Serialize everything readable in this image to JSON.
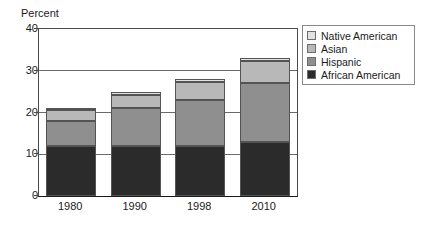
{
  "chart_data": {
    "type": "bar",
    "subtype": "stacked-bar",
    "title": "",
    "xlabel": "",
    "ylabel": "Percent",
    "ylim": [
      0,
      40
    ],
    "yticks": [
      0,
      10,
      20,
      30,
      40
    ],
    "ytick_labels": [
      "0",
      "10",
      "20",
      "30",
      "40"
    ],
    "grid": true,
    "grid_axis": "y",
    "legend_position": "right",
    "categories": [
      "1980",
      "1990",
      "1998",
      "2010"
    ],
    "series": [
      {
        "name": "African American",
        "color": "#2b2b2b",
        "values": [
          12.0,
          12.0,
          12.0,
          13.0
        ]
      },
      {
        "name": "Hispanic",
        "color": "#8f8f8f",
        "values": [
          6.0,
          9.0,
          11.0,
          14.0
        ]
      },
      {
        "name": "Asian",
        "color": "#b8b8b8",
        "values": [
          2.5,
          3.3,
          4.3,
          5.3
        ]
      },
      {
        "name": "Native American",
        "color": "#e3e3e3",
        "values": [
          0.5,
          0.7,
          0.7,
          0.7
        ]
      }
    ],
    "stack_totals": [
      21.0,
      25.0,
      28.0,
      33.0
    ],
    "legend_order": [
      "Native American",
      "Asian",
      "Hispanic",
      "African American"
    ],
    "colors": {
      "native_american": "#e3e3e3",
      "asian": "#b8b8b8",
      "hispanic": "#8f8f8f",
      "african_american": "#2b2b2b",
      "axis": "#1a1a1a",
      "gridline": "#6b6b6b",
      "bar_outline": "#545454",
      "legend_border": "#8a8a8a",
      "background": "#ffffff"
    }
  },
  "axis": {
    "y_title": "Percent"
  },
  "legend": {
    "items": [
      {
        "label": "Native American",
        "color": "#e3e3e3"
      },
      {
        "label": "Asian",
        "color": "#b8b8b8"
      },
      {
        "label": "Hispanic",
        "color": "#8f8f8f"
      },
      {
        "label": "African American",
        "color": "#2b2b2b"
      }
    ]
  }
}
